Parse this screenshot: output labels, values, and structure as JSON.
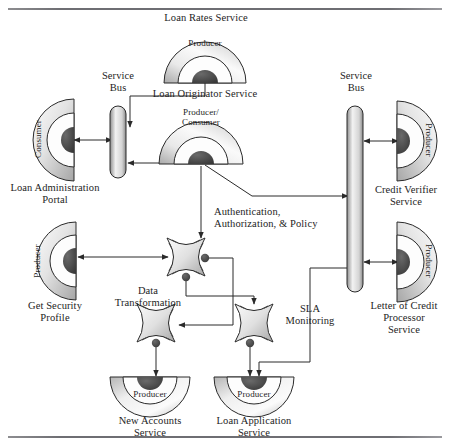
{
  "figure": {
    "type": "soa-service-diagram",
    "top_rule": true,
    "bottom_rule": true
  },
  "labels": {
    "loan_rates_service": "Loan Rates Service",
    "service_bus_left": "Service\nBus",
    "service_bus_right": "Service\nBus",
    "loan_originator_service": "Loan Originator Service",
    "loan_administration_portal": "Loan Administration\nPortal",
    "credit_verifier_service": "Credit Verifier\nService",
    "authentication_policy": "Authentication,\nAuthorization, & Policy",
    "get_security_profile": "Get Security\nProfile",
    "data_transformation": "Data\nTransformation",
    "sla_monitoring": "SLA\nMonitoring",
    "letter_of_credit": "Letter of Credit\nProcessor\nService",
    "new_accounts_service": "New Accounts\nService",
    "loan_application_service": "Loan Application\nService"
  },
  "nodes": [
    {
      "id": "loan-rates",
      "role": "Producer",
      "shape": "semicircle-up",
      "x": 205,
      "y": 62,
      "label_key": "loan_rates_service"
    },
    {
      "id": "loan-originator",
      "role": "Producer/\nConsumer",
      "shape": "semicircle-up",
      "x": 200,
      "y": 142,
      "label_key": "loan_originator_service"
    },
    {
      "id": "loan-admin-portal",
      "role": "Consumer",
      "shape": "semicircle-right",
      "x": 46,
      "y": 140,
      "label_key": "loan_administration_portal"
    },
    {
      "id": "credit-verifier",
      "role": "Producer",
      "shape": "semicircle-left",
      "x": 418,
      "y": 141,
      "label_key": "credit_verifier_service"
    },
    {
      "id": "get-security",
      "role": "Producer",
      "shape": "semicircle-right",
      "x": 46,
      "y": 262,
      "label_key": "get_security_profile"
    },
    {
      "id": "letter-of-credit",
      "role": "Producer",
      "shape": "semicircle-left",
      "x": 418,
      "y": 262,
      "label_key": "letter_of_credit"
    },
    {
      "id": "new-accounts",
      "role": "Producer",
      "shape": "semicircle-down",
      "x": 150,
      "y": 392,
      "label_key": "new_accounts_service"
    },
    {
      "id": "loan-application",
      "role": "Producer",
      "shape": "semicircle-down",
      "x": 254,
      "y": 392,
      "label_key": "loan_application_service"
    }
  ],
  "mediators": [
    {
      "id": "authentication",
      "shape": "clover",
      "x": 185,
      "y": 256,
      "label_key": "authentication_policy"
    },
    {
      "id": "data-transformation",
      "shape": "clover",
      "x": 156,
      "y": 322,
      "label_key": "data_transformation"
    },
    {
      "id": "sla-monitoring",
      "shape": "clover",
      "x": 254,
      "y": 322,
      "label_key": "sla_monitoring"
    }
  ],
  "buses": [
    {
      "id": "service-bus-left",
      "x": 118,
      "y1": 106,
      "y2": 172,
      "label_key": "service_bus_left"
    },
    {
      "id": "service-bus-right",
      "x": 355,
      "y1": 106,
      "y2": 292,
      "label_key": "service_bus_right"
    }
  ],
  "colors": {
    "stroke": "#2a2a2a",
    "port_fill": "#4d4d4d",
    "body_light": "#f3f3f3",
    "body_mid": "#d6d6d6",
    "body_dark": "#9a9a9a",
    "rule": "#6e6e73"
  },
  "connections": [
    {
      "from": "loan-rates",
      "to": "service-bus-left",
      "kind": "arrow"
    },
    {
      "from": "loan-admin-portal",
      "to": "service-bus-left",
      "kind": "double-arrow"
    },
    {
      "from": "loan-originator",
      "to": "service-bus-left",
      "kind": "arrow"
    },
    {
      "from": "loan-originator",
      "to": "service-bus-right",
      "kind": "arrow"
    },
    {
      "from": "service-bus-right",
      "to": "credit-verifier",
      "kind": "double-arrow"
    },
    {
      "from": "service-bus-right",
      "to": "letter-of-credit",
      "kind": "double-arrow"
    },
    {
      "from": "loan-originator",
      "to": "authentication",
      "kind": "arrow"
    },
    {
      "from": "authentication",
      "to": "get-security",
      "kind": "double-arrow"
    },
    {
      "from": "authentication",
      "to": "data-transformation",
      "kind": "arrow"
    },
    {
      "from": "authentication",
      "to": "sla-monitoring",
      "kind": "arrow"
    },
    {
      "from": "data-transformation",
      "to": "new-accounts",
      "kind": "arrow"
    },
    {
      "from": "sla-monitoring",
      "to": "loan-application",
      "kind": "arrow"
    },
    {
      "from": "service-bus-right",
      "to": "loan-application",
      "kind": "arrow"
    }
  ]
}
